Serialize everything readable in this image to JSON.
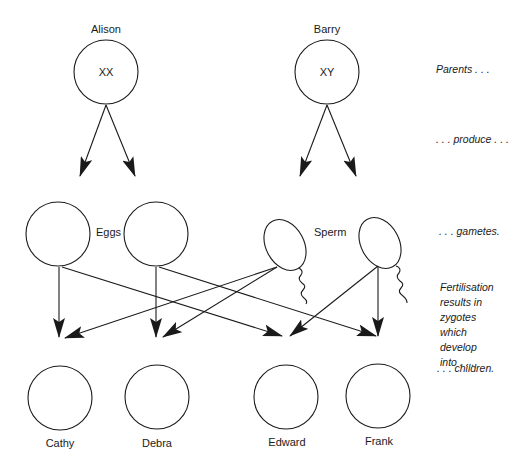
{
  "parents": [
    {
      "name": "Alison",
      "genotype": "XX"
    },
    {
      "name": "Barry",
      "genotype": "XY"
    }
  ],
  "gametes": {
    "eggs_label": "Eggs",
    "sperm_label": "Sperm"
  },
  "children": [
    {
      "name": "Cathy"
    },
    {
      "name": "Debra"
    },
    {
      "name": "Edward"
    },
    {
      "name": "Frank"
    }
  ],
  "annotations": {
    "parents": "Parents . . .",
    "produce": ". . . produce . . .",
    "gametes": ". . . gametes.",
    "fertilisation": [
      "Fertilisation",
      "results in",
      "zygotes",
      "which",
      "develop",
      "into . . ."
    ],
    "children": ". . . children."
  },
  "colors": {
    "line": "#1a1a1a",
    "background": "#ffffff"
  }
}
